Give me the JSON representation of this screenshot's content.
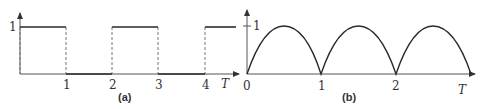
{
  "figure": {
    "panels": [
      {
        "id": "a",
        "caption": "(a)",
        "type": "square-wave",
        "y_tick_label": "1",
        "x_tick_labels": [
          "1",
          "2",
          "3",
          "4"
        ],
        "x_axis_label": "T",
        "segments": [
          {
            "from": 0,
            "to": 1,
            "level": 1
          },
          {
            "from": 1,
            "to": 2,
            "level": 0
          },
          {
            "from": 2,
            "to": 3,
            "level": 1
          },
          {
            "from": 3,
            "to": 4,
            "level": 0
          },
          {
            "from": 4,
            "to": 4.7,
            "level": 1
          }
        ]
      },
      {
        "id": "b",
        "caption": "(b)",
        "type": "rectified-sine",
        "y_tick_label": "1",
        "x_tick_labels": [
          "0",
          "1",
          "2"
        ],
        "x_axis_label": "T",
        "arches": [
          {
            "from": 0,
            "to": 1,
            "peak": 1
          },
          {
            "from": 1,
            "to": 2,
            "peak": 1
          },
          {
            "from": 2,
            "to": 3,
            "peak": 1
          }
        ]
      }
    ]
  },
  "colors": {
    "line": "#2a2a2a",
    "axis": "#555555",
    "dashed": "#777777"
  }
}
